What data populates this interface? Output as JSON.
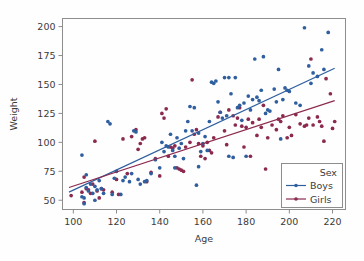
{
  "chart_data": {
    "type": "scatter",
    "title": "",
    "xlabel": "Age",
    "ylabel": "Weight",
    "xlim": [
      95,
      226
    ],
    "ylim": [
      42,
      207
    ],
    "xticks": [
      100,
      120,
      140,
      160,
      180,
      200,
      220
    ],
    "yticks": [
      50,
      75,
      100,
      125,
      150,
      175,
      200
    ],
    "grid": false,
    "legend": {
      "title": "Sex",
      "position": "lower-right",
      "entries": [
        {
          "label": "Boys",
          "color": "#2f5f9e",
          "marker": "circle",
          "line": true
        },
        {
          "label": "Girls",
          "color": "#8b2a4e",
          "marker": "circle",
          "line": true
        }
      ]
    },
    "series": [
      {
        "name": "Boys",
        "color": "#2f5f9e",
        "trendline": {
          "x": [
            98,
            221
          ],
          "y": [
            57,
            164
          ],
          "color": "#2f5f9e"
        },
        "points": [
          [
            104,
            89
          ],
          [
            104,
            53
          ],
          [
            105,
            52
          ],
          [
            105,
            47
          ],
          [
            106,
            72
          ],
          [
            106,
            61
          ],
          [
            107,
            58
          ],
          [
            108,
            64
          ],
          [
            109,
            56
          ],
          [
            110,
            50
          ],
          [
            110,
            62
          ],
          [
            111,
            59
          ],
          [
            112,
            67
          ],
          [
            113,
            60
          ],
          [
            114,
            56
          ],
          [
            116,
            118
          ],
          [
            117,
            116
          ],
          [
            118,
            55
          ],
          [
            119,
            69
          ],
          [
            120,
            75
          ],
          [
            122,
            55
          ],
          [
            123,
            67
          ],
          [
            124,
            70
          ],
          [
            126,
            66
          ],
          [
            127,
            73
          ],
          [
            128,
            110
          ],
          [
            129,
            109
          ],
          [
            130,
            68
          ],
          [
            131,
            64
          ],
          [
            133,
            66
          ],
          [
            134,
            67
          ],
          [
            136,
            73
          ],
          [
            138,
            85
          ],
          [
            140,
            78
          ],
          [
            141,
            100
          ],
          [
            142,
            92
          ],
          [
            143,
            97
          ],
          [
            144,
            96
          ],
          [
            145,
            107
          ],
          [
            146,
            93
          ],
          [
            147,
            88
          ],
          [
            147,
            78
          ],
          [
            148,
            104
          ],
          [
            149,
            95
          ],
          [
            150,
            99
          ],
          [
            151,
            86
          ],
          [
            152,
            110
          ],
          [
            153,
            118
          ],
          [
            154,
            131
          ],
          [
            155,
            110
          ],
          [
            156,
            130
          ],
          [
            157,
            63
          ],
          [
            158,
            79
          ],
          [
            158,
            108
          ],
          [
            159,
            92
          ],
          [
            160,
            99
          ],
          [
            161,
            105
          ],
          [
            162,
            93
          ],
          [
            163,
            118
          ],
          [
            164,
            152
          ],
          [
            165,
            151
          ],
          [
            166,
            153
          ],
          [
            167,
            135
          ],
          [
            168,
            126
          ],
          [
            169,
            121
          ],
          [
            170,
            156
          ],
          [
            171,
            123
          ],
          [
            172,
            156
          ],
          [
            172,
            88
          ],
          [
            173,
            142
          ],
          [
            174,
            87
          ],
          [
            175,
            156
          ],
          [
            176,
            130
          ],
          [
            177,
            132
          ],
          [
            178,
            119
          ],
          [
            179,
            134
          ],
          [
            180,
            88
          ],
          [
            181,
            140
          ],
          [
            182,
            128
          ],
          [
            183,
            137
          ],
          [
            184,
            172
          ],
          [
            185,
            139
          ],
          [
            186,
            136
          ],
          [
            187,
            145
          ],
          [
            188,
            174
          ],
          [
            189,
            125
          ],
          [
            190,
            128
          ],
          [
            191,
            127
          ],
          [
            193,
            146
          ],
          [
            194,
            135
          ],
          [
            195,
            163
          ],
          [
            196,
            103
          ],
          [
            197,
            137
          ],
          [
            198,
            147
          ],
          [
            199,
            145
          ],
          [
            200,
            144
          ],
          [
            203,
            134
          ],
          [
            205,
            132
          ],
          [
            207,
            199
          ],
          [
            209,
            166
          ],
          [
            210,
            151
          ],
          [
            211,
            160
          ],
          [
            213,
            157
          ],
          [
            215,
            180
          ],
          [
            216,
            163
          ],
          [
            218,
            195
          ]
        ]
      },
      {
        "name": "Girls",
        "color": "#8b2a4e",
        "trendline": {
          "x": [
            98,
            221
          ],
          "y": [
            61,
            136
          ],
          "color": "#8b2a4e"
        },
        "points": [
          [
            99,
            54
          ],
          [
            104,
            57
          ],
          [
            105,
            70
          ],
          [
            105,
            48
          ],
          [
            106,
            60
          ],
          [
            107,
            59
          ],
          [
            108,
            56
          ],
          [
            109,
            64
          ],
          [
            110,
            101
          ],
          [
            111,
            58
          ],
          [
            112,
            52
          ],
          [
            113,
            60
          ],
          [
            114,
            59
          ],
          [
            118,
            57
          ],
          [
            120,
            68
          ],
          [
            121,
            55
          ],
          [
            123,
            103
          ],
          [
            125,
            73
          ],
          [
            127,
            105
          ],
          [
            129,
            111
          ],
          [
            130,
            94
          ],
          [
            131,
            99
          ],
          [
            132,
            103
          ],
          [
            133,
            104
          ],
          [
            134,
            66
          ],
          [
            136,
            74
          ],
          [
            138,
            86
          ],
          [
            140,
            71
          ],
          [
            141,
            125
          ],
          [
            142,
            121
          ],
          [
            143,
            129
          ],
          [
            144,
            88
          ],
          [
            145,
            96
          ],
          [
            146,
            95
          ],
          [
            147,
            97
          ],
          [
            148,
            78
          ],
          [
            149,
            77
          ],
          [
            150,
            76
          ],
          [
            151,
            75
          ],
          [
            152,
            96
          ],
          [
            154,
            100
          ],
          [
            155,
            154
          ],
          [
            156,
            107
          ],
          [
            157,
            111
          ],
          [
            158,
            99
          ],
          [
            159,
            88
          ],
          [
            160,
            97
          ],
          [
            161,
            86
          ],
          [
            162,
            100
          ],
          [
            163,
            93
          ],
          [
            164,
            91
          ],
          [
            165,
            104
          ],
          [
            167,
            122
          ],
          [
            168,
            126
          ],
          [
            170,
            110
          ],
          [
            171,
            98
          ],
          [
            172,
            128
          ],
          [
            174,
            123
          ],
          [
            175,
            115
          ],
          [
            176,
            121
          ],
          [
            177,
            130
          ],
          [
            178,
            114
          ],
          [
            179,
            96
          ],
          [
            180,
            113
          ],
          [
            181,
            120
          ],
          [
            182,
            88
          ],
          [
            183,
            117
          ],
          [
            185,
            106
          ],
          [
            186,
            120
          ],
          [
            187,
            113
          ],
          [
            188,
            132
          ],
          [
            189,
            77
          ],
          [
            190,
            104
          ],
          [
            192,
            115
          ],
          [
            194,
            111
          ],
          [
            195,
            120
          ],
          [
            196,
            118
          ],
          [
            197,
            123
          ],
          [
            199,
            104
          ],
          [
            200,
            113
          ],
          [
            201,
            106
          ],
          [
            203,
            124
          ],
          [
            205,
            116
          ],
          [
            207,
            114
          ],
          [
            208,
            115
          ],
          [
            209,
            121
          ],
          [
            210,
            172
          ],
          [
            211,
            115
          ],
          [
            213,
            122
          ],
          [
            214,
            118
          ],
          [
            215,
            114
          ],
          [
            216,
            101
          ],
          [
            217,
            155
          ],
          [
            219,
            142
          ],
          [
            220,
            112
          ],
          [
            221,
            118
          ]
        ]
      }
    ]
  },
  "figure": {
    "background": "#fefefe",
    "frame_color": "#8d8d8d",
    "text_color": "#3b3b3b"
  }
}
